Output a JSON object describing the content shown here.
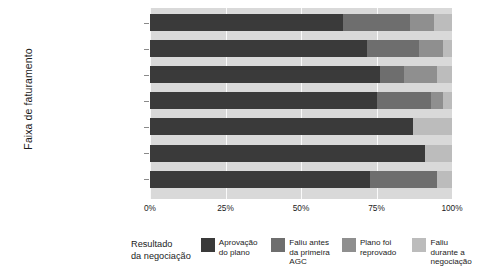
{
  "chart_data": {
    "type": "bar",
    "orientation": "horizontal",
    "stacked": "percent",
    "title": "",
    "xlabel": "",
    "ylabel": "Faixa de faturamento",
    "xlim": [
      0,
      100
    ],
    "xticks": [
      "0%",
      "25%",
      "50%",
      "75%",
      "100%"
    ],
    "xtick_values": [
      0,
      25,
      50,
      75,
      100
    ],
    "grid": true,
    "legend_position": "bottom",
    "legend_title": "Resultado da negociação",
    "categories": [
      "Até R$ 1MM",
      "Entre R$ 1MM e R$ 5MM",
      "Entre R$ 5MM e R$ 10MM",
      "Entre R$ 10MM e R$ 50MM",
      "Entre R$ 50MM e R$ 100MM",
      "Acima de R$ 100MM",
      "Sem informação"
    ],
    "series": [
      {
        "name": "Aprovação do plano",
        "color": "#3a3a3a",
        "values": [
          64,
          72,
          76,
          75,
          87,
          91,
          73
        ]
      },
      {
        "name": "Faliu antes da primeira AGC",
        "color": "#6e6e6e",
        "values": [
          22,
          17,
          8,
          18,
          0,
          0,
          22
        ]
      },
      {
        "name": "Plano foi reprovado",
        "color": "#8f8f8f",
        "values": [
          8,
          8,
          11,
          4,
          0,
          0,
          0
        ]
      },
      {
        "name": "Faliu durante a negociação",
        "color": "#bcbcbc",
        "values": [
          6,
          3,
          5,
          3,
          13,
          9,
          5
        ]
      }
    ]
  },
  "axes": {
    "y_title": "Faixa de faturamento"
  },
  "legend": {
    "title_line1": "Resultado",
    "title_line2": "da negociação",
    "entries": [
      {
        "label": "Aprovação do plano",
        "color": "#3a3a3a",
        "swatch_name": "legend-swatch-aprovacao-do-plano"
      },
      {
        "label": "Faliu antes da primeira AGC",
        "color": "#6e6e6e",
        "swatch_name": "legend-swatch-faliu-antes-da-primeira-agc"
      },
      {
        "label": "Plano foi reprovado",
        "color": "#8f8f8f",
        "swatch_name": "legend-swatch-plano-foi-reprovado"
      },
      {
        "label": "Faliu durante a negociação",
        "color": "#bcbcbc",
        "swatch_name": "legend-swatch-faliu-durante-a-negociacao"
      }
    ]
  },
  "colors": {
    "plot_background": "#d9d9d9",
    "gridline": "#ffffff",
    "text": "#1b1b1b"
  }
}
